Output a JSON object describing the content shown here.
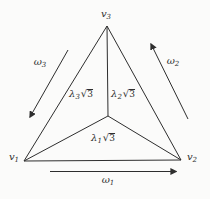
{
  "figure": {
    "background_color": "#fbfbfa",
    "line_color": "#2e2e2e",
    "vertices": {
      "v1": {
        "base": "v",
        "sub": "1"
      },
      "v2": {
        "base": "v",
        "sub": "2"
      },
      "v3": {
        "base": "v",
        "sub": "3"
      }
    },
    "regions": {
      "lambda1": {
        "base": "λ",
        "sub": "1",
        "radical": "√",
        "radicand": "3"
      },
      "lambda2": {
        "base": "λ",
        "sub": "2",
        "radical": "√",
        "radicand": "3"
      },
      "lambda3": {
        "base": "λ",
        "sub": "3",
        "radical": "√",
        "radicand": "3"
      }
    },
    "edge_flows": {
      "omega1": {
        "base": "ω",
        "sub": "1"
      },
      "omega2": {
        "base": "ω",
        "sub": "2"
      },
      "omega3": {
        "base": "ω",
        "sub": "3"
      }
    }
  }
}
